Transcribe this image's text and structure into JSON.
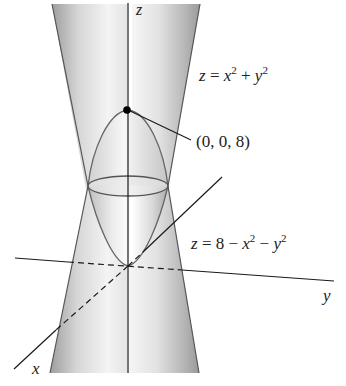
{
  "figure": {
    "axes": {
      "x_label": "x",
      "y_label": "y",
      "z_label": "z"
    },
    "surfaces": [
      {
        "name": "upper-paraboloid",
        "equation": {
          "lhs": "z",
          "eq": " = ",
          "t1": "x",
          "e1": "2",
          "op1": " + ",
          "t2": "y",
          "e2": "2"
        }
      },
      {
        "name": "lower-paraboloid",
        "equation": {
          "lhs": "z",
          "eq": " = 8 − ",
          "t1": "x",
          "e1": "2",
          "op1": " − ",
          "t2": "y",
          "e2": "2"
        }
      }
    ],
    "point": {
      "label": "(0, 0, 8)"
    },
    "colors": {
      "line": "#1a1a1a",
      "surface_light": "#f2f2f2",
      "surface_dark": "#b8b8b8",
      "background": "#ffffff"
    }
  }
}
